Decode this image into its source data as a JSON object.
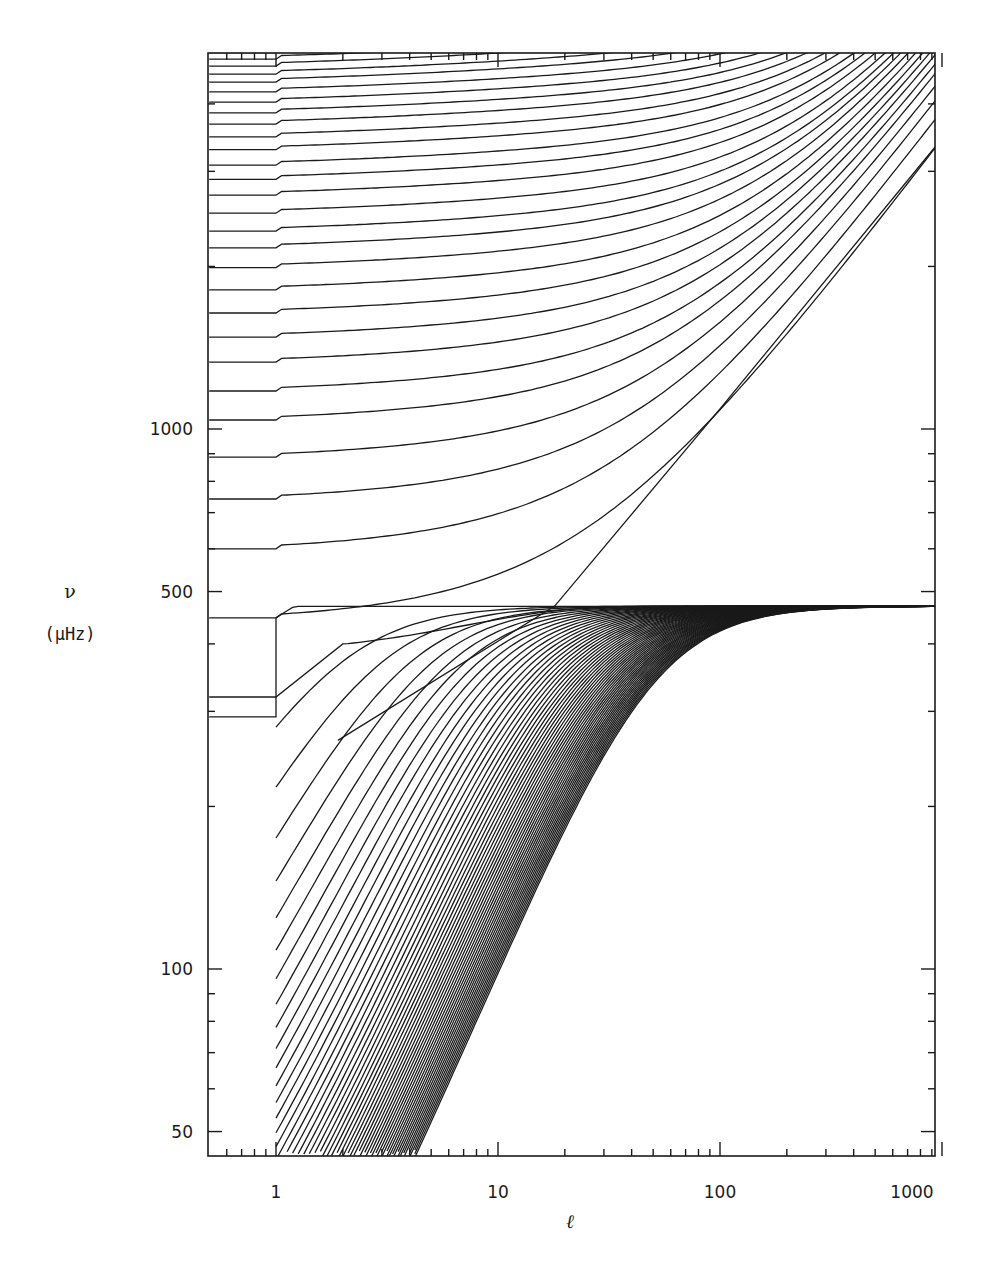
{
  "page": {
    "header_left": "",
    "header_right": ""
  },
  "chart_data": {
    "type": "line",
    "title": "",
    "xlabel": "ℓ",
    "ylabel": "ν",
    "ylabel_unit": "(μHz)",
    "xscale": "log",
    "yscale": "log",
    "xlim": [
      0.5,
      1100
    ],
    "ylim": [
      45,
      5000
    ],
    "grid": false,
    "legend": null,
    "x_ticks": [
      {
        "value": 1,
        "label": "1"
      },
      {
        "value": 10,
        "label": "10"
      },
      {
        "value": 100,
        "label": "100"
      },
      {
        "value": 1000,
        "label": "1000"
      }
    ],
    "y_ticks": [
      {
        "value": 50,
        "label": "50"
      },
      {
        "value": 100,
        "label": "100"
      },
      {
        "value": 500,
        "label": "500"
      },
      {
        "value": 1000,
        "label": "1000"
      }
    ],
    "x_minor_ticks": [
      0.6,
      0.7,
      0.8,
      0.9,
      2,
      3,
      4,
      5,
      6,
      7,
      8,
      9,
      20,
      30,
      40,
      50,
      60,
      70,
      80,
      90,
      200,
      300,
      400,
      500,
      600,
      700,
      800,
      900
    ],
    "y_minor_ticks": [
      60,
      70,
      80,
      90,
      200,
      300,
      400,
      600,
      700,
      800,
      900,
      2000,
      3000,
      4000
    ],
    "series": [
      {
        "name": "p-modes",
        "description": "acoustic modes, frequency at l=1 then rising with l",
        "nu_at_l1": [
          319,
          447,
          600,
          742,
          887,
          1039,
          1176,
          1330,
          1480,
          1640,
          1810,
          1990,
          2165,
          2325,
          2510,
          2710,
          2900,
          3080,
          3290,
          3475,
          3670,
          3850,
          4030,
          4210,
          4390,
          4540,
          4700,
          4840,
          4980
        ],
        "kinked_lowest": {
          "nu_l1": 319,
          "nu_l2": 400
        }
      },
      {
        "name": "f-mode",
        "description": "surface gravity mode, nu proportional to sqrt(l)",
        "points": [
          [
            1.9,
            265
          ],
          [
            18,
            470
          ],
          [
            100,
            1090
          ],
          [
            1000,
            3450
          ],
          [
            1100,
            3620
          ]
        ]
      },
      {
        "name": "g-modes",
        "description": "gravity modes rising with l, saturating near 470 μHz",
        "asymptote_nu": 470,
        "nu_at_l1": [
          293,
          187,
          163,
          143,
          126,
          112,
          101,
          92,
          84,
          77,
          71,
          66,
          61.5,
          57.5,
          54,
          51,
          48,
          45.5
        ],
        "count_total": 60
      }
    ]
  }
}
